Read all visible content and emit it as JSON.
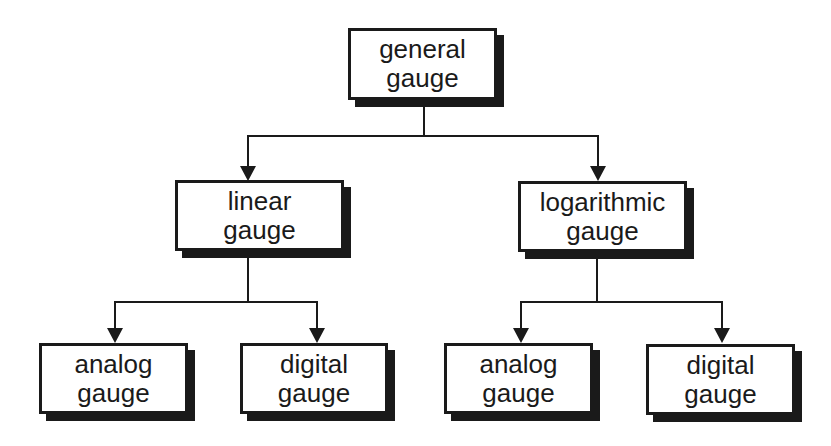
{
  "diagram": {
    "type": "hierarchy-tree",
    "colors": {
      "stroke": "#1a1a1a",
      "fill": "#ffffff",
      "shadow": "#1a1a1a"
    },
    "root": {
      "id": "general",
      "line1": "general",
      "line2": "gauge"
    },
    "level1": [
      {
        "id": "linear",
        "line1": "linear",
        "line2": "gauge"
      },
      {
        "id": "logarithmic",
        "line1": "logarithmic",
        "line2": "gauge"
      }
    ],
    "level2": [
      {
        "id": "linear-analog",
        "parent": "linear",
        "line1": "analog",
        "line2": "gauge"
      },
      {
        "id": "linear-digital",
        "parent": "linear",
        "line1": "digital",
        "line2": "gauge"
      },
      {
        "id": "log-analog",
        "parent": "logarithmic",
        "line1": "analog",
        "line2": "gauge"
      },
      {
        "id": "log-digital",
        "parent": "logarithmic",
        "line1": "digital",
        "line2": "gauge"
      }
    ],
    "edges": [
      [
        "general",
        "linear"
      ],
      [
        "general",
        "logarithmic"
      ],
      [
        "linear",
        "linear-analog"
      ],
      [
        "linear",
        "linear-digital"
      ],
      [
        "logarithmic",
        "log-analog"
      ],
      [
        "logarithmic",
        "log-digital"
      ]
    ]
  }
}
